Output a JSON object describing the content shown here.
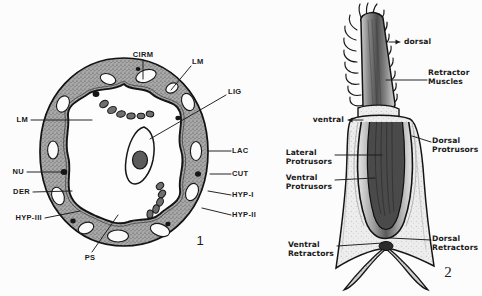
{
  "plate": {
    "background_color": "#fcfcfc",
    "ink_color": "#1a1a1a",
    "tissue_fill": "#9a9a9a",
    "width": 482,
    "height": 296
  },
  "figure1": {
    "number": "1",
    "caption": "Transverse section of body wall",
    "labels": [
      {
        "id": "cirm",
        "text": "CIRM",
        "x": 143,
        "y": 55,
        "align": "center",
        "leader": "M143,60 L143,79"
      },
      {
        "id": "lm_top",
        "text": "LM",
        "x": 192,
        "y": 62,
        "align": "left",
        "leader": "M191,66 L171,90"
      },
      {
        "id": "lig",
        "text": "LIG",
        "x": 228,
        "y": 92,
        "align": "left",
        "leader": "M226,95 L150,139"
      },
      {
        "id": "lm_left",
        "text": "LM",
        "x": 28,
        "y": 120,
        "align": "right",
        "leader": "M31,120 L92,120"
      },
      {
        "id": "lac",
        "text": "LAC",
        "x": 232,
        "y": 151,
        "align": "left",
        "leader": "M231,151 L208,151"
      },
      {
        "id": "cut",
        "text": "CUT",
        "x": 232,
        "y": 174,
        "align": "left",
        "leader": "M231,174 L210,174"
      },
      {
        "id": "nu",
        "text": "NU",
        "x": 24,
        "y": 172,
        "align": "right",
        "leader": "M27,172 L62,172"
      },
      {
        "id": "hyp1",
        "text": "HYP-I",
        "x": 232,
        "y": 195,
        "align": "left",
        "leader": "M231,195 L208,191"
      },
      {
        "id": "der",
        "text": "DER",
        "x": 30,
        "y": 192,
        "align": "right",
        "leader": "M33,192 L72,191"
      },
      {
        "id": "hyp2",
        "text": "HYP-II",
        "x": 232,
        "y": 215,
        "align": "left",
        "leader": "M231,215 L202,208"
      },
      {
        "id": "hyp3",
        "text": "HYP-III",
        "x": 42,
        "y": 218,
        "align": "right",
        "leader": "M45,218 L80,211"
      },
      {
        "id": "ps",
        "text": "PS",
        "x": 90,
        "y": 258,
        "align": "center",
        "leader": "M92,252 L118,215"
      }
    ]
  },
  "figure2": {
    "number": "2",
    "caption": "Proboscis and retractor musculature",
    "orientation": [
      {
        "id": "dorsal",
        "text": "dorsal",
        "x": 404,
        "y": 42,
        "align": "left",
        "arrow": "M389,42 L400,42",
        "arrowhead": "right"
      },
      {
        "id": "ventral",
        "text": "ventral",
        "x": 344,
        "y": 120,
        "align": "right",
        "arrow": "M363,120 L348,120",
        "arrowhead": "left"
      }
    ],
    "labels": [
      {
        "id": "retractor-muscles",
        "text": "Retractor\nMuscles",
        "x": 428,
        "y": 78,
        "align": "left",
        "leader": "M427,80 L386,80"
      },
      {
        "id": "dorsal-protrusors",
        "text": "Dorsal\nProtrusors",
        "x": 432,
        "y": 146,
        "align": "left",
        "leader": "M431,142 L412,136"
      },
      {
        "id": "lateral-protrusors",
        "text": "Lateral\nProtrusors",
        "x": 332,
        "y": 158,
        "align": "right",
        "leader": "M335,155 L382,155"
      },
      {
        "id": "ventral-protrusors",
        "text": "Ventral\nProtrusors",
        "x": 332,
        "y": 183,
        "align": "right",
        "leader": "M335,180 L375,178"
      },
      {
        "id": "dorsal-retractors",
        "text": "Dorsal\nRetractors",
        "x": 432,
        "y": 244,
        "align": "left",
        "leader": "M431,240 L390,238"
      },
      {
        "id": "ventral-retractors",
        "text": "Ventral\nRetractors",
        "x": 334,
        "y": 250,
        "align": "right",
        "leader": "M337,246 L383,243"
      }
    ]
  }
}
